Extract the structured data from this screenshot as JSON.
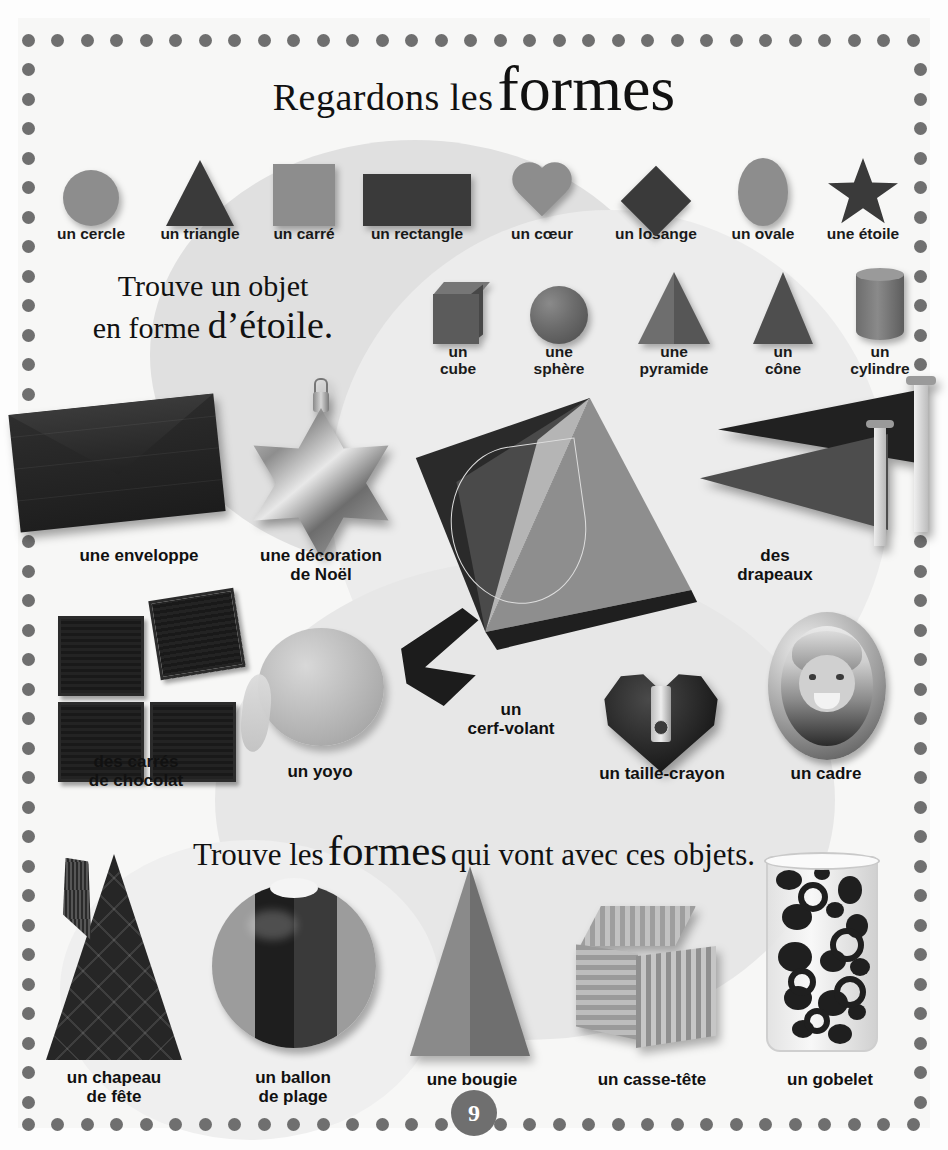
{
  "page": {
    "number": "9",
    "title": {
      "part1": "Regardons les",
      "part2": "formes"
    },
    "prompt_star": {
      "line1": "Trouve un objet",
      "line2_plain": "en forme",
      "line2_bold": "d’étoile."
    },
    "prompt_shapes": {
      "before": "Trouve les",
      "emphasis": "formes",
      "after": "qui vont avec ces objets."
    }
  },
  "shapes_2d": [
    {
      "label": "un cercle",
      "icon": "circle-shape",
      "color": "#8d8d8d"
    },
    {
      "label": "un triangle",
      "icon": "triangle-shape",
      "color": "#3a3a3a"
    },
    {
      "label": "un carré",
      "icon": "square-shape",
      "color": "#8d8d8d"
    },
    {
      "label": "un rectangle",
      "icon": "rectangle-shape",
      "color": "#3a3a3a"
    },
    {
      "label": "un cœur",
      "icon": "heart-shape",
      "color": "#8d8d8d"
    },
    {
      "label": "un losange",
      "icon": "diamond-shape",
      "color": "#3a3a3a"
    },
    {
      "label": "un ovale",
      "icon": "oval-shape",
      "color": "#8d8d8d"
    },
    {
      "label": "une étoile",
      "icon": "star-shape",
      "color": "#3a3a3a"
    }
  ],
  "shapes_3d": [
    {
      "line1": "un",
      "line2": "cube",
      "icon": "cube-shape"
    },
    {
      "line1": "une",
      "line2": "sphère",
      "icon": "sphere-shape"
    },
    {
      "line1": "une",
      "line2": "pyramide",
      "icon": "pyramid-shape"
    },
    {
      "line1": "un",
      "line2": "cône",
      "icon": "cone-shape"
    },
    {
      "line1": "un",
      "line2": "cylindre",
      "icon": "cylinder-shape"
    }
  ],
  "objects_middle": [
    {
      "caption": "une enveloppe",
      "name": "envelope-photo"
    },
    {
      "caption_l1": "une décoration",
      "caption_l2": "de Noël",
      "name": "christmas-star-photo"
    },
    {
      "caption_l1": "des",
      "caption_l2": "drapeaux",
      "name": "flags-photo"
    },
    {
      "caption_l1": "des carrés",
      "caption_l2": "de chocolat",
      "name": "chocolate-squares-photo"
    },
    {
      "caption": "un yoyo",
      "name": "yoyo-photo"
    },
    {
      "caption_l1": "un",
      "caption_l2": "cerf-volant",
      "name": "kite-photo"
    },
    {
      "caption": "un taille-crayon",
      "name": "pencil-sharpener-photo"
    },
    {
      "caption": "un cadre",
      "name": "picture-frame-photo"
    }
  ],
  "objects_bottom": [
    {
      "caption_l1": "un chapeau",
      "caption_l2": "de fête",
      "name": "party-hat-photo"
    },
    {
      "caption_l1": "un ballon",
      "caption_l2": "de plage",
      "name": "beach-ball-photo"
    },
    {
      "caption": "une bougie",
      "name": "candle-photo"
    },
    {
      "caption": "un casse-tête",
      "name": "puzzle-cube-photo"
    },
    {
      "caption": "un gobelet",
      "name": "tumbler-glass-photo"
    }
  ],
  "colors": {
    "dot_border": "#6f6f6f",
    "dark_shape": "#3a3a3a",
    "mid_shape": "#8d8d8d",
    "page_bg": "#f7f7f6"
  }
}
